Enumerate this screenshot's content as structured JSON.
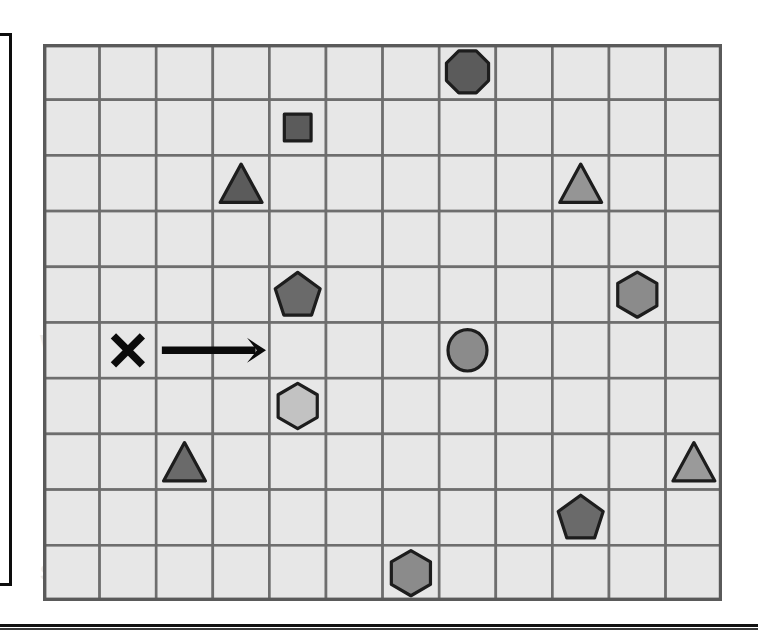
{
  "page": {
    "background_color": "#ffffff",
    "bottom_rule_color": "#111111",
    "left_frame_border_color": "#0d0d0d"
  },
  "ghost_text": [
    {
      "text": "O B J E C T S   A R E",
      "x": 60,
      "y": 96,
      "size": 22
    },
    {
      "text": "W H I C H   O N E   I S",
      "x": 40,
      "y": 330,
      "size": 22
    },
    {
      "text": "O X O X",
      "x": 90,
      "y": 440,
      "size": 22
    },
    {
      "text": "S T A R T",
      "x": 40,
      "y": 560,
      "size": 22
    }
  ],
  "grid": {
    "columns": 12,
    "rows": 10,
    "cell_width": 56.6,
    "cell_height": 55.7,
    "cell_fill": "#e7e7e7",
    "cell_border": "#6e6e6e",
    "outline_color": "#5a5a5a"
  },
  "palette": {
    "dark_gray": "#5b5b5b",
    "medium_gray": "#858585",
    "light_gray": "#aeaeae",
    "lighter_gray": "#c6c6c6",
    "outline": "#1d1d1d",
    "marker_black": "#0b0b0b"
  },
  "chart_data": {
    "type": "scatter",
    "xlabel": "column",
    "ylabel": "row",
    "grid": true,
    "xlim": [
      1,
      12
    ],
    "ylim": [
      1,
      10
    ],
    "legend": "none",
    "categories": [
      "octagon",
      "square",
      "triangle",
      "pentagon",
      "hexagon",
      "circle",
      "x-marker",
      "arrow"
    ],
    "items": [
      {
        "shape": "octagon",
        "col": 8,
        "row": 1,
        "color": "#5b5b5b",
        "size": 0.78,
        "label": "dark octagon"
      },
      {
        "shape": "square",
        "col": 5,
        "row": 2,
        "color": "#5b5b5b",
        "size": 0.62,
        "label": "dark square"
      },
      {
        "shape": "triangle",
        "col": 4,
        "row": 3,
        "color": "#5b5b5b",
        "size": 0.8,
        "label": "dark triangle"
      },
      {
        "shape": "triangle",
        "col": 10,
        "row": 3,
        "color": "#959595",
        "size": 0.8,
        "label": "gray triangle"
      },
      {
        "shape": "pentagon",
        "col": 5,
        "row": 5,
        "color": "#6a6a6a",
        "size": 0.8,
        "label": "dark pentagon"
      },
      {
        "shape": "hexagon",
        "col": 11,
        "row": 5,
        "color": "#8b8b8b",
        "size": 0.78,
        "label": "gray hexagon"
      },
      {
        "shape": "x-marker",
        "col": 2,
        "row": 6,
        "color": "#0b0b0b",
        "size": 0.52,
        "label": "X start marker"
      },
      {
        "shape": "arrow",
        "col": 3,
        "row": 6,
        "span": 2,
        "color": "#0b0b0b",
        "size": 1.0,
        "direction": "right",
        "label": "right arrow"
      },
      {
        "shape": "circle",
        "col": 8,
        "row": 6,
        "color": "#8b8b8b",
        "size": 0.7,
        "label": "gray circle"
      },
      {
        "shape": "hexagon",
        "col": 5,
        "row": 7,
        "color": "#c2c2c2",
        "size": 0.78,
        "label": "light hexagon"
      },
      {
        "shape": "triangle",
        "col": 3,
        "row": 8,
        "color": "#6a6a6a",
        "size": 0.8,
        "label": "dark triangle"
      },
      {
        "shape": "triangle",
        "col": 12,
        "row": 8,
        "color": "#9a9a9a",
        "size": 0.8,
        "label": "gray triangle"
      },
      {
        "shape": "pentagon",
        "col": 10,
        "row": 9,
        "color": "#6a6a6a",
        "size": 0.8,
        "label": "dark pentagon"
      },
      {
        "shape": "hexagon",
        "col": 7,
        "row": 10,
        "color": "#8b8b8b",
        "size": 0.78,
        "label": "gray hexagon"
      }
    ]
  }
}
